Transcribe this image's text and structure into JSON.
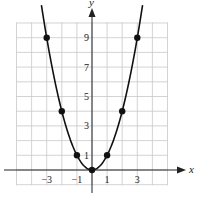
{
  "chart_data": {
    "type": "line",
    "title": "",
    "xlabel": "x",
    "ylabel": "y",
    "xlim": [
      -5,
      5
    ],
    "ylim": [
      -1,
      10
    ],
    "grid": true,
    "x_tick_labels": [
      "-3",
      "-1",
      "1",
      "3"
    ],
    "x_ticks": [
      -3,
      -1,
      1,
      3
    ],
    "y_tick_labels": [
      "1",
      "3",
      "5",
      "7",
      "9"
    ],
    "y_ticks": [
      1,
      3,
      5,
      7,
      9
    ],
    "series": [
      {
        "name": "y = x^2",
        "equation": "y = x^2",
        "points": [
          {
            "x": -3,
            "y": 9
          },
          {
            "x": -2,
            "y": 4
          },
          {
            "x": -1,
            "y": 1
          },
          {
            "x": 0,
            "y": 0
          },
          {
            "x": 1,
            "y": 1
          },
          {
            "x": 2,
            "y": 4
          },
          {
            "x": 3,
            "y": 9
          }
        ]
      }
    ]
  },
  "axes": {
    "x_label": "x",
    "y_label": "y"
  }
}
